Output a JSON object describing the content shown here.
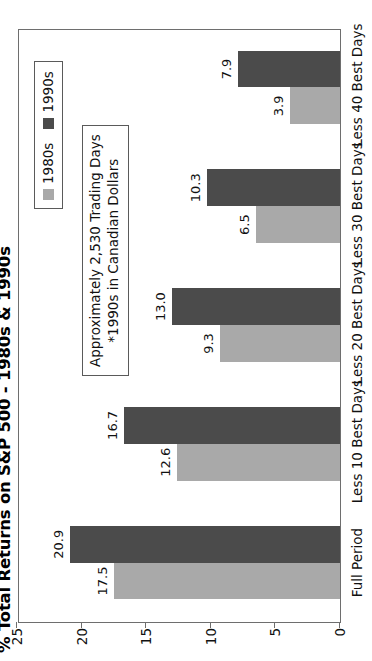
{
  "chart_data": {
    "type": "bar",
    "orientation": "vertical-rendered-rotated",
    "title": "% Total Returns on S&P 500 - 1980s & 1990s",
    "xlabel": "",
    "ylabel": "",
    "ylim": [
      0,
      25
    ],
    "yticks": [
      0,
      5,
      10,
      15,
      20,
      25
    ],
    "ytick_labels": [
      "0",
      "5",
      "10",
      "15",
      "20",
      "25"
    ],
    "grid": false,
    "legend_position": "top-right",
    "categories": [
      "Full Period",
      "Less 10 Best Days",
      "Less 20 Best Days",
      "Less 30 Best Days",
      "Less 40 Best Days"
    ],
    "series": [
      {
        "name": "1980s",
        "color": "#a9a9a9",
        "values": [
          17.5,
          12.6,
          9.3,
          6.5,
          3.9
        ],
        "labels": [
          "17.5",
          "12.6",
          "9.3",
          "6.5",
          "3.9"
        ]
      },
      {
        "name": "1990s",
        "color": "#4b4b4b",
        "values": [
          20.9,
          16.7,
          13.0,
          10.3,
          7.9
        ],
        "labels": [
          "20.9",
          "16.7",
          "13.0",
          "10.3",
          "7.9"
        ]
      }
    ],
    "annotations": [
      "Approximately 2,530 Trading Days",
      "*1990s in Canadian Dollars"
    ]
  },
  "legend": {
    "entries": [
      {
        "label": "1980s",
        "color": "#a9a9a9"
      },
      {
        "label": "1990s",
        "color": "#4b4b4b"
      }
    ]
  },
  "annotation": {
    "line1": "Approximately 2,530 Trading Days",
    "line2": "*1990s in Canadian Dollars"
  },
  "colors": {
    "series_1980s": "#a9a9a9",
    "series_1990s": "#4b4b4b",
    "axis": "#6e6e6e",
    "text": "#111111",
    "background": "#ffffff"
  }
}
